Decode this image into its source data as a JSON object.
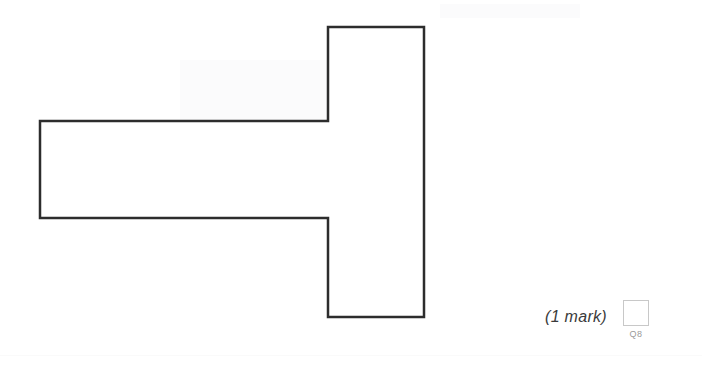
{
  "page": {
    "background_color": "#ffffff",
    "width": 702,
    "height": 370
  },
  "figure": {
    "name": "t-shape-outline",
    "stroke_color": "#2d2d2d",
    "fill_color": "#ffffff",
    "stroke_width": 2.5,
    "points": "40,121 328,121 328,27 424,27 424,317 328,317 328,218 40,218",
    "vertices": [
      [
        40,
        121
      ],
      [
        328,
        121
      ],
      [
        328,
        27
      ],
      [
        424,
        27
      ],
      [
        424,
        317
      ],
      [
        328,
        317
      ],
      [
        328,
        218
      ],
      [
        40,
        218
      ]
    ]
  },
  "footer": {
    "mark_text": "(1 mark)",
    "answer_box": {
      "value": "",
      "border_color": "#c8c8c8"
    },
    "question_tag": "Q8"
  }
}
